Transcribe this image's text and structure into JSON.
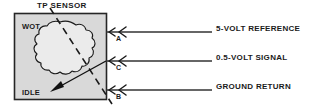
{
  "diagram": {
    "title": "TP SENSOR",
    "sensor_box": {
      "positions": {
        "wot": "WOT",
        "idle": "IDLE"
      },
      "fill_color": "#d9d9d9",
      "border_color": "#262626",
      "wiper_blob_color": "#ebebeb"
    },
    "terminals": [
      {
        "id": "A",
        "label": "A",
        "wire_label": "5-VOLT REFERENCE",
        "y": 32
      },
      {
        "id": "C",
        "label": "C",
        "wire_label": "0.5-VOLT SIGNAL",
        "y": 61
      },
      {
        "id": "B",
        "label": "B",
        "wire_label": "GROUND RETURN",
        "y": 90
      }
    ],
    "colors": {
      "line": "#333333",
      "text": "#1a1a1a",
      "background": "#ffffff"
    }
  }
}
